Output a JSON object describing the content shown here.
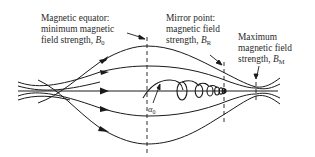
{
  "figure": {
    "type": "magnetic-mirror-diagram",
    "labels": {
      "equator": {
        "line1": "Magnetic equator:",
        "line2": "minimum magnetic",
        "line3_prefix": "field strength, ",
        "symbol": "B",
        "subscript": "0"
      },
      "mirror_point": {
        "line1": "Mirror point:",
        "line2": "magnetic field",
        "line3_prefix": "strength, ",
        "symbol": "B",
        "subscript": "R"
      },
      "maximum": {
        "line1": "Maximum",
        "line2": "magnetic field",
        "line3_prefix": "strength, ",
        "symbol": "B",
        "subscript": "M"
      },
      "pitch_angle": {
        "symbol": "α",
        "subscript": "0"
      }
    },
    "field_lines_count": 7,
    "arrow_direction": "right",
    "colors": {
      "line": "#1a1a1a",
      "text": "#2a2a2a",
      "background": "#ffffff"
    }
  }
}
